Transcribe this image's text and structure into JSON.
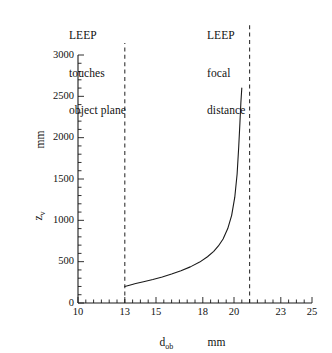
{
  "chart_data": {
    "type": "line",
    "title": "",
    "xlabel": "d_ob",
    "xlabel_text": "d",
    "xlabel_sub": "ob",
    "xunits": "mm",
    "ylabel_text": "z",
    "ylabel_sub": "v",
    "yunits": "mm",
    "xlim": [
      10,
      25
    ],
    "ylim": [
      0,
      3000
    ],
    "xticks": [
      10,
      13,
      15,
      18,
      20,
      23,
      25
    ],
    "xtick_labels": [
      "10",
      "13",
      "15",
      "18",
      "20",
      "23",
      "25"
    ],
    "yticks": [
      0,
      500,
      1000,
      1500,
      2000,
      2500,
      3000
    ],
    "ytick_labels": [
      "0",
      "500",
      "1000",
      "1500",
      "2000",
      "2500",
      "3000"
    ],
    "x_minor_step": 0.5,
    "y_minor_step": 100,
    "grid": false,
    "legend": false,
    "series": [
      {
        "name": "z_v vs d_ob",
        "color": "#1a1a1a",
        "x": [
          13.0,
          13.3,
          13.7,
          14.2,
          14.8,
          15.4,
          16.0,
          16.6,
          17.2,
          17.8,
          18.3,
          18.7,
          19.0,
          19.3,
          19.6,
          19.85,
          20.05,
          20.2,
          20.3,
          20.38,
          20.44,
          20.5
        ],
        "y": [
          200,
          215,
          235,
          258,
          285,
          315,
          350,
          390,
          437,
          495,
          560,
          625,
          690,
          775,
          900,
          1060,
          1280,
          1560,
          1880,
          2180,
          2420,
          2600
        ]
      }
    ],
    "vlines": [
      {
        "x": 13.0,
        "style": "dashed",
        "color": "#333333",
        "label": "LEEP touches object plane",
        "label_lines": [
          "LEEP",
          "touches",
          "object plane"
        ]
      },
      {
        "x": 21.0,
        "style": "dashed",
        "color": "#333333",
        "label": "LEEP focal distance",
        "label_lines": [
          "LEEP",
          "focal",
          "distance"
        ]
      }
    ],
    "annotations": [
      {
        "id": "annot-left",
        "lines": [
          "LEEP",
          "touches",
          "object plane"
        ]
      },
      {
        "id": "annot-right",
        "lines": [
          "LEEP",
          "focal",
          "distance"
        ]
      }
    ]
  }
}
